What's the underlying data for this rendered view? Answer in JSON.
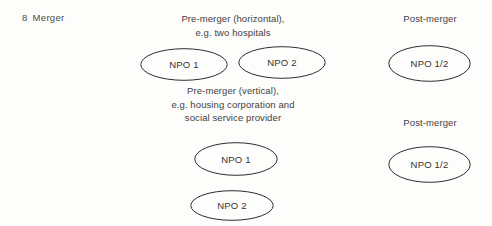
{
  "figure": {
    "caption_number": "8",
    "caption_title": "Merger",
    "background_color": "#fdfdfb",
    "stroke_color": "#2e2e2e",
    "text_color": "#3a3a3a"
  },
  "labels": {
    "premerger_horizontal": {
      "line1": "Pre-merger (horizontal),",
      "line2": "e.g. two hospitals"
    },
    "premerger_vertical": {
      "line1": "Pre-merger (vertical),",
      "line2": "e.g. housing corporation and",
      "line3": "social service provider"
    },
    "postmerger_top": "Post-merger",
    "postmerger_bottom": "Post-merger"
  },
  "nodes": {
    "horizontal_premerger": [
      {
        "label": "NPO 1"
      },
      {
        "label": "NPO 2"
      }
    ],
    "horizontal_postmerger": [
      {
        "label": "NPO 1/2"
      }
    ],
    "vertical_premerger": [
      {
        "label": "NPO 1"
      },
      {
        "label": "NPO 2"
      }
    ],
    "vertical_postmerger": [
      {
        "label": "NPO 1/2"
      }
    ]
  }
}
